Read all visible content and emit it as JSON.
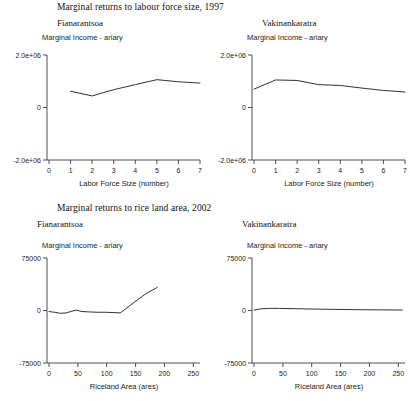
{
  "figures": [
    {
      "id": "labour",
      "title": "Marginal returns to labour force size, 1997",
      "panels": [
        {
          "region": "Fianarantsoa",
          "ylabel": "Marginal Income - ariary",
          "xlabel": "Labor Force Size (number)",
          "yticks": [
            "2.0e+06",
            "0",
            "-2.0e+06"
          ]
        },
        {
          "region": "Vakinankaratra",
          "ylabel": "Marginal Income - ariary",
          "xlabel": "Labor Force Size (number)",
          "yticks": [
            "2.0e+06",
            "0",
            "-2.0e+06"
          ]
        }
      ]
    },
    {
      "id": "riceland",
      "title": "Marginal returns to rice land area, 2002",
      "panels": [
        {
          "region": "Fianarantsoa",
          "ylabel": "Marginal Income - ariary",
          "xlabel": "Riceland Area (ares)",
          "yticks": [
            "75000",
            "0",
            "-75000"
          ]
        },
        {
          "region": "Vakinankaratra",
          "ylabel": "Marginal Income - ariary",
          "xlabel": "Riceland Area (ares)",
          "yticks": [
            "75000",
            "0",
            "-75000"
          ]
        }
      ]
    }
  ],
  "chart_data": [
    {
      "type": "line",
      "title": "Marginal returns to labour force size, 1997",
      "panel": "Fianarantsoa",
      "xlabel": "Labor Force Size (number)",
      "ylabel": "Marginal Income - ariary",
      "xticks": [
        0,
        1,
        2,
        3,
        4,
        5,
        6,
        7
      ],
      "yticks": [
        -2000000,
        0,
        2000000
      ],
      "xlim": [
        0,
        7
      ],
      "ylim": [
        -2000000,
        2000000
      ],
      "grid": false,
      "legend": "none",
      "x": [
        1,
        2,
        3,
        4,
        5,
        6,
        7
      ],
      "values": [
        620000,
        440000,
        680000,
        870000,
        1060000,
        980000,
        930000
      ]
    },
    {
      "type": "line",
      "title": "Marginal returns to labour force size, 1997",
      "panel": "Vakinankaratra",
      "xlabel": "Labor Force Size (number)",
      "ylabel": "Marginal Income - ariary",
      "xticks": [
        0,
        1,
        2,
        3,
        4,
        5,
        6,
        7
      ],
      "yticks": [
        -2000000,
        0,
        2000000
      ],
      "xlim": [
        0,
        7
      ],
      "ylim": [
        -2000000,
        2000000
      ],
      "grid": false,
      "legend": "none",
      "x": [
        0,
        1,
        2,
        3,
        4,
        5,
        6,
        7
      ],
      "values": [
        700000,
        1050000,
        1030000,
        870000,
        840000,
        740000,
        650000,
        590000
      ]
    },
    {
      "type": "line",
      "title": "Marginal returns to rice land area, 2002",
      "panel": "Fianarantsoa",
      "xlabel": "Riceland Area (ares)",
      "ylabel": "Marginal Income - ariary",
      "xticks": [
        0,
        50,
        100,
        150,
        200,
        250
      ],
      "yticks": [
        -75000,
        0,
        75000
      ],
      "xlim": [
        0,
        265
      ],
      "ylim": [
        -75000,
        75000
      ],
      "grid": false,
      "legend": "none",
      "x": [
        0,
        10,
        20,
        30,
        40,
        48,
        58,
        70,
        85,
        100,
        115,
        125,
        150,
        170,
        190
      ],
      "values": [
        -1500,
        -2500,
        -4000,
        -3500,
        -1000,
        500,
        -1500,
        -2000,
        -2500,
        -2500,
        -3000,
        -3500,
        12000,
        24000,
        33000
      ]
    },
    {
      "type": "line",
      "title": "Marginal returns to rice land area, 2002",
      "panel": "Vakinankaratra",
      "xlabel": "Riceland Area (ares)",
      "ylabel": "Marginal Income - ariary",
      "xticks": [
        0,
        50,
        100,
        150,
        200,
        250
      ],
      "yticks": [
        -75000,
        0,
        75000
      ],
      "xlim": [
        0,
        265
      ],
      "ylim": [
        -75000,
        75000
      ],
      "grid": false,
      "legend": "none",
      "x": [
        0,
        10,
        25,
        45,
        70,
        100,
        140,
        180,
        220,
        260
      ],
      "values": [
        500,
        2200,
        3000,
        3000,
        2600,
        2100,
        1600,
        1200,
        900,
        700
      ]
    }
  ]
}
